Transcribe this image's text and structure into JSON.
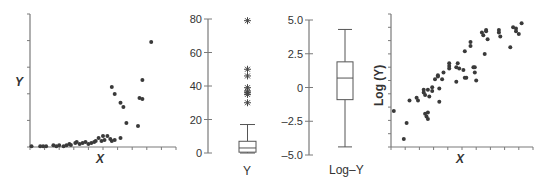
{
  "chart_data": [
    {
      "type": "scatter",
      "title": "",
      "xlabel": "X",
      "ylabel": "Y",
      "grid": false,
      "x_ticks": 10,
      "y_ticks": 5,
      "xlim": [
        0,
        10
      ],
      "ylim": [
        0,
        100
      ],
      "points": [
        [
          0.1,
          0.5
        ],
        [
          0.7,
          0.5
        ],
        [
          0.9,
          0.5
        ],
        [
          1.1,
          0.5
        ],
        [
          1.6,
          1.3
        ],
        [
          1.8,
          0.5
        ],
        [
          2.0,
          1.3
        ],
        [
          2.3,
          0.5
        ],
        [
          2.5,
          1.3
        ],
        [
          2.7,
          2.3
        ],
        [
          2.8,
          1.5
        ],
        [
          3.1,
          3.0
        ],
        [
          3.2,
          3.8
        ],
        [
          3.4,
          2.3
        ],
        [
          3.6,
          3.0
        ],
        [
          3.8,
          3.8
        ],
        [
          4.0,
          2.3
        ],
        [
          4.2,
          3.0
        ],
        [
          4.4,
          3.8
        ],
        [
          4.5,
          4.5
        ],
        [
          4.7,
          6.8
        ],
        [
          4.9,
          4.5
        ],
        [
          5.0,
          8.3
        ],
        [
          5.1,
          5.3
        ],
        [
          5.3,
          8.3
        ],
        [
          5.5,
          6.0
        ],
        [
          5.6,
          4.5
        ],
        [
          5.8,
          5.3
        ],
        [
          6.2,
          6.8
        ],
        [
          6.6,
          18.0
        ],
        [
          7.4,
          15.8
        ],
        [
          6.2,
          33.2
        ],
        [
          7.5,
          36.8
        ],
        [
          7.7,
          36.1
        ],
        [
          6.4,
          30.1
        ],
        [
          5.6,
          45.1
        ],
        [
          5.8,
          39.8
        ],
        [
          7.7,
          50.4
        ],
        [
          8.3,
          79.0
        ]
      ]
    },
    {
      "type": "box",
      "title": "",
      "xlabel": "Y",
      "ylabel": "",
      "ylim": [
        0,
        80
      ],
      "yticks": [
        "80",
        "60",
        "40",
        "20",
        "0"
      ],
      "whisker_high": 17,
      "q3": 7,
      "median": 3,
      "q1": 0.5,
      "whisker_low": 0,
      "outliers": [
        79,
        50,
        46,
        39,
        37,
        36,
        35,
        30
      ]
    },
    {
      "type": "box",
      "title": "",
      "xlabel": "Log–Y",
      "ylabel": "",
      "ylim": [
        -5.0,
        5.0
      ],
      "yticks": [
        "5.0",
        "2.5",
        "0",
        "–2.5",
        "–5.0"
      ],
      "whisker_high": 4.3,
      "q3": 1.9,
      "median": 0.7,
      "q1": -0.9,
      "whisker_low": -4.4,
      "outliers": []
    },
    {
      "type": "scatter",
      "title": "",
      "xlabel": "X",
      "ylabel": "Log (Y)",
      "grid": false,
      "x_ticks": 10,
      "y_ticks": 10,
      "xlim": [
        0,
        10
      ],
      "ylim": [
        0,
        10
      ],
      "points": [
        [
          0.2,
          2.7
        ],
        [
          0.9,
          0.6
        ],
        [
          1.1,
          1.8
        ],
        [
          1.3,
          3.5
        ],
        [
          1.8,
          3.7
        ],
        [
          1.9,
          3.5
        ],
        [
          2.3,
          4.1
        ],
        [
          2.3,
          4.3
        ],
        [
          2.4,
          3.9
        ],
        [
          2.4,
          2.5
        ],
        [
          2.5,
          2.3
        ],
        [
          2.6,
          2.1
        ],
        [
          2.6,
          2.6
        ],
        [
          2.6,
          4.3
        ],
        [
          2.7,
          3.8
        ],
        [
          2.9,
          4.5
        ],
        [
          2.9,
          4.2
        ],
        [
          3.3,
          5.4
        ],
        [
          3.3,
          5.3
        ],
        [
          3.1,
          5.1
        ],
        [
          3.4,
          4.4
        ],
        [
          3.4,
          3.4
        ],
        [
          3.6,
          5.1
        ],
        [
          3.7,
          5.6
        ],
        [
          4.1,
          5.9
        ],
        [
          4.1,
          6.3
        ],
        [
          4.1,
          6.1
        ],
        [
          4.6,
          6.0
        ],
        [
          4.6,
          4.9
        ],
        [
          4.7,
          6.3
        ],
        [
          4.8,
          5.9
        ],
        [
          5.1,
          5.8
        ],
        [
          5.2,
          5.2
        ],
        [
          5.2,
          7.2
        ],
        [
          5.3,
          5.2
        ],
        [
          5.6,
          7.6
        ],
        [
          5.8,
          6.0
        ],
        [
          5.9,
          6.0
        ],
        [
          5.9,
          5.6
        ],
        [
          5.6,
          7.9
        ],
        [
          6.0,
          5.0
        ],
        [
          6.4,
          8.6
        ],
        [
          6.5,
          8.4
        ],
        [
          6.6,
          7.0
        ],
        [
          6.7,
          8.8
        ],
        [
          6.7,
          8.7
        ],
        [
          6.8,
          8.1
        ],
        [
          7.6,
          8.6
        ],
        [
          7.7,
          8.3
        ],
        [
          7.6,
          8.8
        ],
        [
          8.6,
          9.0
        ],
        [
          8.8,
          8.7
        ],
        [
          8.8,
          8.9
        ],
        [
          9.0,
          8.5
        ],
        [
          8.4,
          7.5
        ],
        [
          9.2,
          9.3
        ]
      ]
    }
  ],
  "labels": {
    "p1_y": "Y",
    "p1_x": "X",
    "p2_x": "Y",
    "p3_x": "Log–Y",
    "p4_y": "Log (Y)",
    "p4_x": "X",
    "p2_ticks": [
      "80",
      "60",
      "40",
      "20",
      "0"
    ],
    "p3_ticks": [
      "5.0",
      "2.5",
      "0",
      "–2.5",
      "–5.0"
    ]
  }
}
